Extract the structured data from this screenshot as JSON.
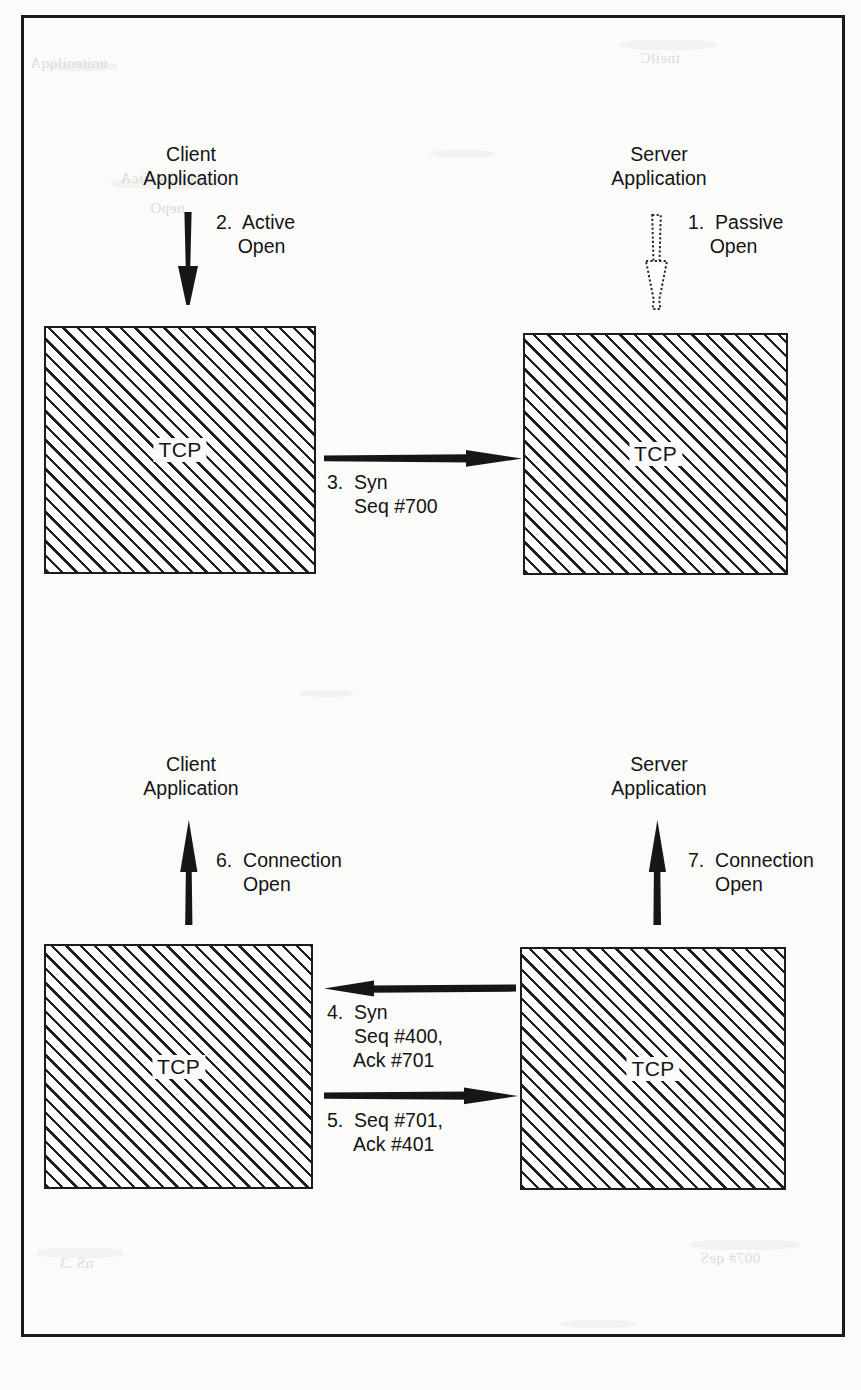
{
  "figure": {
    "frame_color": "#1a1a1a",
    "ink_color": "#141414",
    "paper_color": "#fbfbfa"
  },
  "panels": [
    {
      "id": "top",
      "client": {
        "app_label": "Client\nApplication",
        "tcp_label": "TCP",
        "arrow": {
          "name": "active-open-arrow",
          "direction": "down",
          "style": "solid"
        },
        "step": {
          "number": "2.",
          "text": "Active\nOpen",
          "label": "2.  Active\n    Open"
        }
      },
      "server": {
        "app_label": "Server\nApplication",
        "tcp_label": "TCP",
        "arrow": {
          "name": "passive-open-arrow",
          "direction": "down",
          "style": "hollow-dotted"
        },
        "step": {
          "number": "1.",
          "text": "Passive\nOpen",
          "label": "1.  Passive\n    Open"
        }
      },
      "messages": [
        {
          "name": "syn-seq-700",
          "direction": "client-to-server",
          "step_number": "3.",
          "lines": [
            "3.  Syn",
            "     Seq #700"
          ],
          "label": "3.  Syn\n     Seq #700"
        }
      ]
    },
    {
      "id": "bottom",
      "client": {
        "app_label": "Client\nApplication",
        "tcp_label": "TCP",
        "arrow": {
          "name": "connection-open-client-arrow",
          "direction": "up",
          "style": "solid"
        },
        "step": {
          "number": "6.",
          "text": "Connection\nOpen",
          "label": "6.  Connection\n     Open"
        }
      },
      "server": {
        "app_label": "Server\nApplication",
        "tcp_label": "TCP",
        "arrow": {
          "name": "connection-open-server-arrow",
          "direction": "up",
          "style": "solid"
        },
        "step": {
          "number": "7.",
          "text": "Connection\nOpen",
          "label": "7.  Connection\n     Open"
        }
      },
      "messages": [
        {
          "name": "syn-ack-seq-400-ack-701",
          "direction": "server-to-client",
          "step_number": "4.",
          "lines": [
            "4.  Syn",
            "     Seq #400,",
            "     Ack #701"
          ],
          "label": "4.  Syn\n     Seq #400,\n     Ack #701"
        },
        {
          "name": "ack-seq-701-ack-401",
          "direction": "client-to-server",
          "step_number": "5.",
          "lines": [
            "5.  Seq #701,",
            "     Ack #401"
          ],
          "label": "5.  Seq #701,\n     Ack #401"
        }
      ]
    }
  ],
  "bleed_through": [
    {
      "text": "uoiteoilqqA",
      "x": 30,
      "y": 55
    },
    {
      "text": "tneilC",
      "x": 640,
      "y": 50
    },
    {
      "text": "nepO evitcA",
      "x": 120,
      "y": 170
    },
    {
      "text": "nepO",
      "x": 150,
      "y": 200
    },
    {
      "text": "nS  .3",
      "x": 60,
      "y": 1255
    },
    {
      "text": "007# qeS",
      "x": 700,
      "y": 1250
    }
  ]
}
